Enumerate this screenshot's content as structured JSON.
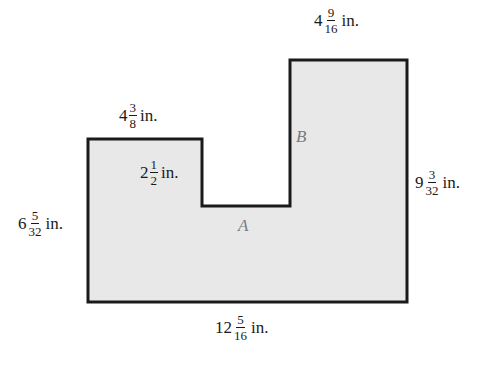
{
  "figure": {
    "fill_color": "#e8e8e8",
    "stroke_color": "#1a1a1a",
    "region_label_color": "#7a7a7a",
    "shape_points": "88,139 202,139 202,206 290,206 290,60 407,60 407,302 88,302"
  },
  "regions": {
    "a": "A",
    "b": "B"
  },
  "dimensions": {
    "top_b": {
      "whole": "4",
      "num": "9",
      "den": "16",
      "unit": "in."
    },
    "top_left": {
      "whole": "4",
      "num": "3",
      "den": "8",
      "unit": "in."
    },
    "notch_depth": {
      "whole": "2",
      "num": "1",
      "den": "2",
      "unit": "in."
    },
    "left_height": {
      "whole": "6",
      "num": "5",
      "den": "32",
      "unit": "in."
    },
    "right_height": {
      "whole": "9",
      "num": "3",
      "den": "32",
      "unit": "in."
    },
    "bottom_width": {
      "whole": "12",
      "num": "5",
      "den": "16",
      "unit": "in."
    }
  }
}
